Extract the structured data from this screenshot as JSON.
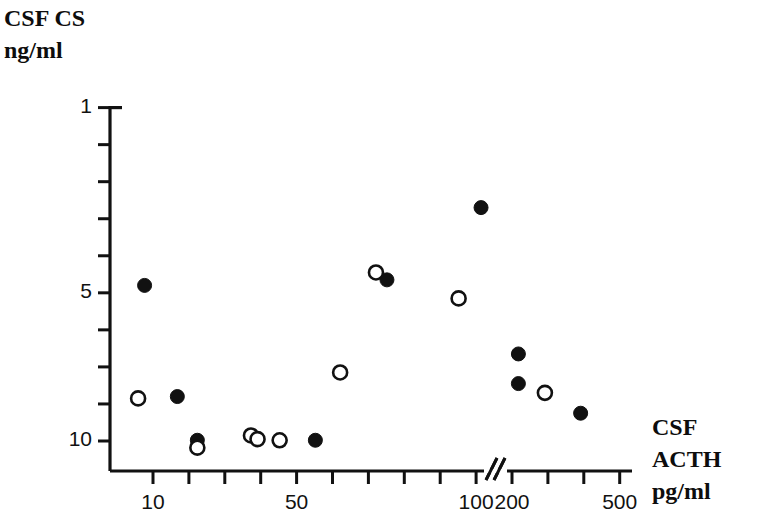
{
  "figure": {
    "background": "#ffffff",
    "ink": "#111111"
  },
  "y_axis": {
    "title_line1": "CSF CS",
    "title_line2": "ng/ml",
    "labels": [
      "10",
      "5",
      "1"
    ]
  },
  "x_axis": {
    "title_line1": "CSF",
    "title_line2": "ACTH",
    "title_line3": "pg/ml",
    "labels": [
      "10",
      "50",
      "100",
      "200",
      "500"
    ],
    "break_marker": "//"
  },
  "chart_data": {
    "type": "scatter",
    "title": "",
    "xlabel": "CSF ACTH pg/ml",
    "ylabel": "CSF CS ng/ml",
    "grid": false,
    "legend": false,
    "x_scale": "segmented-log-with-break",
    "x_tick_values": [
      10,
      20,
      30,
      40,
      50,
      60,
      70,
      80,
      90,
      100,
      200,
      300,
      400,
      500
    ],
    "x_labeled_ticks": [
      10,
      50,
      100,
      200,
      500
    ],
    "x_axis_break_between": [
      100,
      200
    ],
    "y_scale": "linear",
    "ylim": [
      0.6,
      10
    ],
    "y_tick_values": [
      1,
      2,
      3,
      4,
      5,
      6,
      7,
      8,
      9,
      10
    ],
    "y_labeled_ticks": [
      1,
      5,
      10
    ],
    "series": [
      {
        "name": "filled",
        "marker": "filled-circle",
        "color": "#111111",
        "points": [
          {
            "x": 8.5,
            "y": 5.2
          },
          {
            "x": 16,
            "y": 2.2
          },
          {
            "x": 22,
            "y": 1.02
          },
          {
            "x": 55,
            "y": 1.02
          },
          {
            "x": 75,
            "y": 5.35
          },
          {
            "x": 110,
            "y": 7.3
          },
          {
            "x": 215,
            "y": 3.35
          },
          {
            "x": 215,
            "y": 2.55
          },
          {
            "x": 390,
            "y": 1.75
          }
        ]
      },
      {
        "name": "open",
        "marker": "open-circle",
        "color": "#111111",
        "points": [
          {
            "x": 7.5,
            "y": 2.15
          },
          {
            "x": 22,
            "y": 0.82
          },
          {
            "x": 37,
            "y": 1.15
          },
          {
            "x": 39,
            "y": 1.05
          },
          {
            "x": 45,
            "y": 1.02
          },
          {
            "x": 62,
            "y": 2.85
          },
          {
            "x": 72,
            "y": 5.55
          },
          {
            "x": 95,
            "y": 4.85
          },
          {
            "x": 290,
            "y": 2.3
          }
        ]
      }
    ]
  }
}
